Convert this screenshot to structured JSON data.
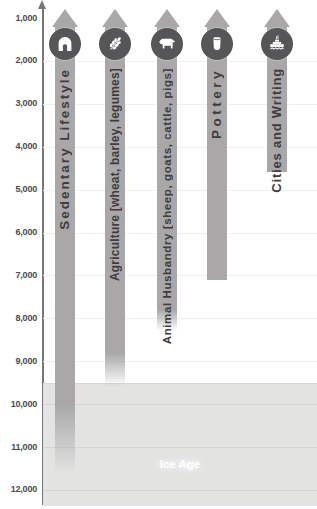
{
  "colors": {
    "bar": "#a9a7a8",
    "icon_circle": "#565658",
    "bar_label_text": "#3d3d3f",
    "axis_line": "#77777a",
    "tick_text": "#4a4a4c",
    "gridline": "#f1f1f1",
    "ice_background": "#e3e3e2",
    "ice_gridline": "#d4d4d4",
    "ice_label_text": "#ffffff"
  },
  "chart_data": {
    "type": "bar",
    "orientation": "vertical-timeline-arrows",
    "description_visible_only": "Timeline bars of years (no title shown); each bar is an upward arrow continuing past 1,000 toward the present",
    "y_axis": {
      "tick_values": [
        1000,
        2000,
        3000,
        4000,
        5000,
        6000,
        7000,
        8000,
        9000,
        10000,
        11000,
        12000
      ],
      "tick_labels": [
        "1,000",
        "2,000",
        "3,000",
        "4,000",
        "5,000",
        "6,000",
        "7,000",
        "8,000",
        "9,000",
        "10,000",
        "11,000",
        "12,000"
      ],
      "range": [
        800,
        12350
      ],
      "grid": "on"
    },
    "series": [
      {
        "label": "Sedentary Lifestyle",
        "icon": "hut-icon",
        "start": 800,
        "solid_until": 10000,
        "fade_until": 11600
      },
      {
        "label": "Agriculture [wheat, barley, legumes]",
        "icon": "wheat-icon",
        "start": 800,
        "solid_until": 8800,
        "fade_until": 9600
      },
      {
        "label": "Animal Husbandry [sheep, goats, cattle, pigs]",
        "icon": "cow-icon",
        "start": 800,
        "solid_until": 7800,
        "fade_until": 8300
      },
      {
        "label": "Pottery",
        "icon": "pot-icon",
        "start": 800,
        "solid_until": 7100,
        "fade_until": 7100
      },
      {
        "label": "Cities and Writing",
        "icon": "city-icon",
        "start": 800,
        "solid_until": 4600,
        "fade_until": 4600
      }
    ],
    "ice_age": {
      "label": "Ice Age",
      "from": 9500,
      "to": 12350
    }
  }
}
